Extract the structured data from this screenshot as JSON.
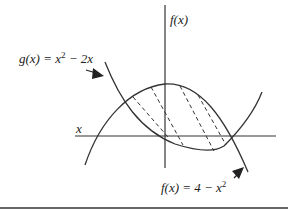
{
  "diagram": {
    "type": "area-between-curves",
    "axes": {
      "x_label": "x",
      "y_label": "f(x)"
    },
    "curves": [
      {
        "name": "g",
        "equation_label": "g(x) = x² − 2x",
        "shape": "upward parabola"
      },
      {
        "name": "f",
        "equation_label": "f(x) = 4 − x²",
        "shape": "downward parabola"
      }
    ],
    "labels": {
      "g_prefix": "g(x) = x",
      "g_exp": "2",
      "g_suffix": " − 2x",
      "f_prefix": "f(x) = 4 − x",
      "f_exp": "2",
      "y_axis": "f(x)",
      "x_axis": "x"
    },
    "region": {
      "fill": "dashed hatch lines",
      "between": [
        "f",
        "g"
      ]
    },
    "colors": {
      "stroke": "#333333",
      "background": "#ffffff"
    }
  }
}
